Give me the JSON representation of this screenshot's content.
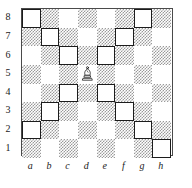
{
  "diagram": {
    "kind": "chess-board-diagram",
    "orientation": "white-bottom",
    "board_size": 8
  },
  "labels": {
    "files": [
      "a",
      "b",
      "c",
      "d",
      "e",
      "f",
      "g",
      "h"
    ],
    "ranks": [
      "8",
      "7",
      "6",
      "5",
      "4",
      "3",
      "2",
      "1"
    ]
  },
  "colors": {
    "light_square": "#ffffff",
    "dark_square": "#9a9a9a",
    "border": "#4a4a4a",
    "marker_outline": "#1c1c1c",
    "piece_outline": "#1c1c1c",
    "piece_fill": "#ffffff",
    "text": "#1a1a1a"
  },
  "pieces": [
    {
      "id": "white-bishop-d5",
      "type": "bishop",
      "color": "white",
      "square": "d5",
      "file": 3,
      "rank": 5,
      "glyph": "bishop-icon"
    }
  ],
  "marked_squares": [
    {
      "square": "a8",
      "file": 0,
      "rank": 8
    },
    {
      "square": "g8",
      "file": 6,
      "rank": 8
    },
    {
      "square": "b7",
      "file": 1,
      "rank": 7
    },
    {
      "square": "f7",
      "file": 5,
      "rank": 7
    },
    {
      "square": "c6",
      "file": 2,
      "rank": 6
    },
    {
      "square": "e6",
      "file": 4,
      "rank": 6
    },
    {
      "square": "c4",
      "file": 2,
      "rank": 4
    },
    {
      "square": "e4",
      "file": 4,
      "rank": 4
    },
    {
      "square": "b3",
      "file": 1,
      "rank": 3
    },
    {
      "square": "f3",
      "file": 5,
      "rank": 3
    },
    {
      "square": "a2",
      "file": 0,
      "rank": 2
    },
    {
      "square": "g2",
      "file": 6,
      "rank": 2
    },
    {
      "square": "h1",
      "file": 7,
      "rank": 1
    }
  ]
}
